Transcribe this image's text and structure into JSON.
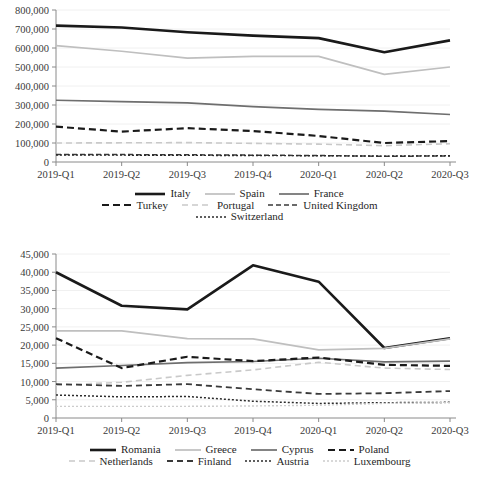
{
  "chart_data": [
    {
      "id": "top",
      "type": "line",
      "title": "",
      "xlabel": "",
      "ylabel": "",
      "categories": [
        "2019-Q1",
        "2019-Q2",
        "2019-Q3",
        "2019-Q4",
        "2020-Q1",
        "2020-Q2",
        "2020-Q3"
      ],
      "ylim": [
        0,
        800000
      ],
      "yticks": [
        0,
        100000,
        200000,
        300000,
        400000,
        500000,
        600000,
        700000,
        800000
      ],
      "ytick_labels": [
        "0",
        "100,000",
        "200,000",
        "300,000",
        "400,000",
        "500,000",
        "600,000",
        "700,000",
        "800,000"
      ],
      "grid": true,
      "legend_position": "bottom",
      "series": [
        {
          "name": "Italy",
          "color": "#1a1a1a",
          "width": 2.6,
          "dash": "none",
          "values": [
            718000,
            708000,
            683000,
            665000,
            652000,
            578000,
            640000
          ]
        },
        {
          "name": "Spain",
          "color": "#bfbfbf",
          "width": 1.7,
          "dash": "none",
          "values": [
            612000,
            583000,
            547000,
            556000,
            556000,
            461000,
            500000
          ]
        },
        {
          "name": "France",
          "color": "#6e6e6e",
          "width": 1.7,
          "dash": "none",
          "values": [
            325000,
            318000,
            311000,
            291000,
            277000,
            268000,
            250000
          ]
        },
        {
          "name": "Turkey",
          "color": "#1a1a1a",
          "width": 2.2,
          "dash": "7,4",
          "values": [
            186000,
            160000,
            178000,
            163000,
            137000,
            100000,
            110000
          ]
        },
        {
          "name": "Portugal",
          "color": "#c9c9c9",
          "width": 1.6,
          "dash": "6,4",
          "values": [
            100000,
            101000,
            102000,
            98000,
            94000,
            86000,
            96000
          ]
        },
        {
          "name": "United Kingdom",
          "color": "#3a3a3a",
          "width": 1.5,
          "dash": "5,3",
          "values": [
            40000,
            39000,
            38000,
            36000,
            34000,
            30000,
            32000
          ]
        },
        {
          "name": "Switzerland",
          "color": "#2b2b2b",
          "width": 1.4,
          "dash": "2,2",
          "values": [
            37000,
            36000,
            35000,
            34000,
            33000,
            31000,
            33000
          ]
        }
      ]
    },
    {
      "id": "bottom",
      "type": "line",
      "title": "",
      "xlabel": "",
      "ylabel": "",
      "categories": [
        "2019-Q1",
        "2019-Q2",
        "2019-Q3",
        "2019-Q4",
        "2020-Q1",
        "2020-Q2",
        "2020-Q3"
      ],
      "ylim": [
        0,
        45000
      ],
      "yticks": [
        0,
        5000,
        10000,
        15000,
        20000,
        25000,
        30000,
        35000,
        40000,
        45000
      ],
      "ytick_labels": [
        "0",
        "5,000",
        "10,000",
        "15,000",
        "20,000",
        "25,000",
        "30,000",
        "35,000",
        "40,000",
        "45,000"
      ],
      "grid": true,
      "legend_position": "bottom",
      "series": [
        {
          "name": "Romania",
          "color": "#1a1a1a",
          "width": 2.6,
          "dash": "none",
          "values": [
            40000,
            30800,
            29800,
            41900,
            37400,
            19200,
            21900
          ]
        },
        {
          "name": "Greece",
          "color": "#bfbfbf",
          "width": 1.7,
          "dash": "none",
          "values": [
            23900,
            23900,
            21800,
            21700,
            18700,
            19100,
            21700
          ]
        },
        {
          "name": "Cyprus",
          "color": "#6e6e6e",
          "width": 1.7,
          "dash": "none",
          "values": [
            13700,
            14400,
            15200,
            15500,
            16400,
            15400,
            15600
          ]
        },
        {
          "name": "Poland",
          "color": "#1a1a1a",
          "width": 2.2,
          "dash": "7,4",
          "values": [
            21900,
            13700,
            16800,
            15600,
            16600,
            14600,
            14300
          ]
        },
        {
          "name": "Netherlands",
          "color": "#c9c9c9",
          "width": 1.6,
          "dash": "6,4",
          "values": [
            9000,
            9800,
            11700,
            13200,
            15300,
            13700,
            13300
          ]
        },
        {
          "name": "Finland",
          "color": "#3a3a3a",
          "width": 1.8,
          "dash": "6,4",
          "values": [
            9300,
            8800,
            9300,
            7900,
            6600,
            6800,
            7400
          ]
        },
        {
          "name": "Austria",
          "color": "#2b2b2b",
          "width": 1.5,
          "dash": "2,2",
          "values": [
            6300,
            5800,
            5900,
            4600,
            4000,
            4200,
            4300
          ]
        },
        {
          "name": "Luxembourg",
          "color": "#cccccc",
          "width": 1.4,
          "dash": "2,2",
          "values": [
            3200,
            3200,
            3200,
            3300,
            3500,
            4000,
            4200
          ]
        }
      ]
    }
  ],
  "top_chart": {
    "legend_rows": [
      [
        "Italy",
        "Spain",
        "France"
      ],
      [
        "Turkey",
        "Portugal",
        "United Kingdom"
      ],
      [
        "Switzerland"
      ]
    ]
  },
  "bottom_chart": {
    "legend_rows": [
      [
        "Romania",
        "Greece",
        "Cyprus",
        "Poland"
      ],
      [
        "Netherlands",
        "Finland",
        "Austria",
        "Luxembourg"
      ]
    ]
  }
}
